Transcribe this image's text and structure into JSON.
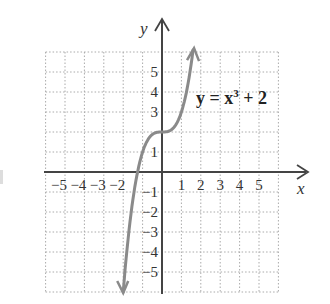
{
  "chart_data": {
    "type": "line",
    "title": "",
    "function": "y = x^3 + 2",
    "annotation": {
      "base": "y = x",
      "exponent": "3",
      "rest": " + 2"
    },
    "xlabel": "x",
    "ylabel": "y",
    "xlim": [
      -6,
      6
    ],
    "ylim": [
      -6,
      6
    ],
    "grid": true,
    "x_ticks": [
      "−5",
      "−4",
      "−3",
      "−2",
      "1",
      "2",
      "3",
      "4",
      "5"
    ],
    "y_ticks": [
      "5",
      "4",
      "3",
      "1",
      "−1",
      "−2",
      "−3",
      "−4",
      "−5"
    ],
    "series": [
      {
        "name": "y = x^3 + 2",
        "x": [
          -2.0,
          -1.9,
          -1.75,
          -1.5,
          -1.25,
          -1.0,
          -0.75,
          -0.5,
          -0.25,
          0,
          0.25,
          0.5,
          0.75,
          1.0,
          1.25,
          1.5,
          1.6
        ],
        "y": [
          -6.0,
          -4.86,
          -3.36,
          -1.38,
          0.05,
          1.0,
          1.58,
          1.88,
          1.98,
          2.0,
          2.02,
          2.13,
          2.42,
          3.0,
          3.95,
          5.38,
          6.1
        ]
      }
    ],
    "color": "#8a8a8a"
  }
}
